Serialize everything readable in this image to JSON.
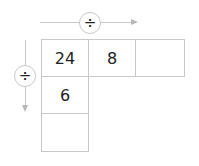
{
  "operators": {
    "horizontal": {
      "symbol": "÷",
      "icon": "divide-icon",
      "direction": "right"
    },
    "vertical": {
      "symbol": "÷",
      "icon": "divide-icon",
      "direction": "down"
    }
  },
  "grid": {
    "row0": [
      "24",
      "8",
      ""
    ],
    "col0": [
      "24",
      "6",
      ""
    ]
  },
  "cells": {
    "r0c0": "24",
    "r0c1": "8",
    "r0c2": "",
    "r1c0": "6",
    "r2c0": ""
  }
}
